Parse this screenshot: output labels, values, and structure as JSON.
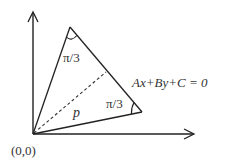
{
  "diagram": {
    "type": "geometry",
    "labels": {
      "top_angle": "π/3",
      "right_angle": "π/3",
      "line_equation": "Ax+By+C = 0",
      "distance": "p",
      "origin": "(0,0)"
    },
    "colors": {
      "stroke": "#222222",
      "text": "#333333",
      "background": "#ffffff"
    }
  }
}
